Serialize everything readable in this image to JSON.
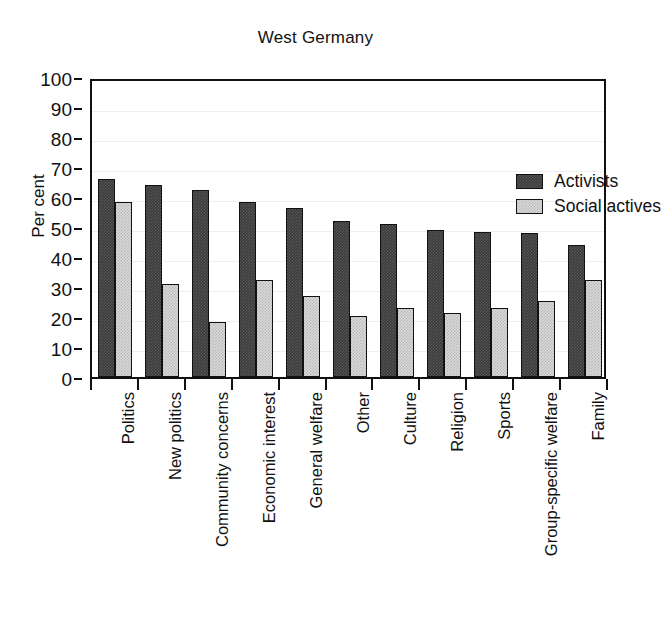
{
  "chart_data": {
    "type": "bar",
    "title": "West Germany",
    "xlabel": "",
    "ylabel": "Per cent",
    "ylim": [
      0,
      100
    ],
    "yticks": [
      0,
      10,
      20,
      30,
      40,
      50,
      60,
      70,
      80,
      90,
      100
    ],
    "grid": true,
    "legend_position": "top-right",
    "categories": [
      "Politics",
      "New politics",
      "Community concerns",
      "Economic interest",
      "General welfare",
      "Other",
      "Culture",
      "Religion",
      "Sports",
      "Group-specific welfare",
      "Family"
    ],
    "series": [
      {
        "name": "Activists",
        "color": "#3b3b3b",
        "values": [
          66,
          64,
          62.5,
          58.5,
          56.5,
          52,
          51,
          49,
          48.5,
          48,
          44
        ]
      },
      {
        "name": "Social actives",
        "color": "#d9d9d9",
        "values": [
          58.5,
          31,
          18.5,
          32.5,
          27,
          20.5,
          23,
          21.5,
          23,
          25.5,
          32.5
        ]
      }
    ]
  }
}
